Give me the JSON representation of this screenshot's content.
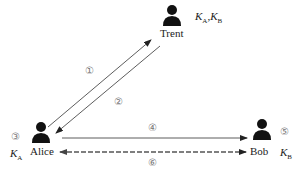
{
  "diagram": {
    "type": "key-distribution-protocol",
    "nodes": [
      {
        "id": "trent",
        "label": "Trent",
        "keys": "K_A,K_B",
        "keys_main": [
          "K",
          "K"
        ],
        "keys_sub": [
          "A",
          "B"
        ]
      },
      {
        "id": "alice",
        "label": "Alice",
        "keys": "K_A",
        "key_main": "K",
        "key_sub": "A",
        "step": "③"
      },
      {
        "id": "bob",
        "label": "Bob",
        "keys": "K_B",
        "key_main": "K",
        "key_sub": "B",
        "step": "⑤"
      }
    ],
    "steps": [
      {
        "id": 1,
        "label": "①",
        "from": "alice",
        "to": "trent",
        "style": "solid"
      },
      {
        "id": 2,
        "label": "②",
        "from": "trent",
        "to": "alice",
        "style": "solid"
      },
      {
        "id": 3,
        "label": "③",
        "at": "alice"
      },
      {
        "id": 4,
        "label": "④",
        "from": "alice",
        "to": "bob",
        "style": "solid"
      },
      {
        "id": 5,
        "label": "⑤",
        "at": "bob"
      },
      {
        "id": 6,
        "label": "⑥",
        "from": "bob",
        "to": "alice",
        "style": "dashed-bidirectional"
      }
    ],
    "colors": {
      "line": "#333333",
      "dashed": "#666666",
      "icon": "#111111",
      "step_label": "#777777"
    }
  }
}
